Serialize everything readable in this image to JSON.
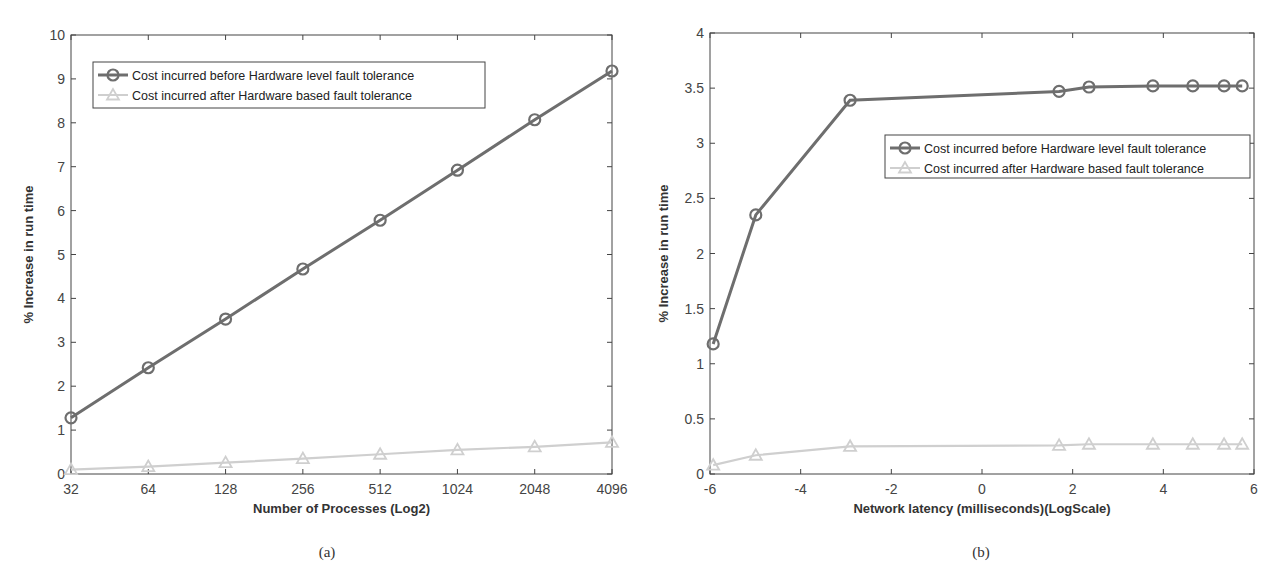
{
  "chart_data": [
    {
      "id": "a",
      "type": "line",
      "caption": "(a)",
      "title": "",
      "xlabel": "Number of Processes (Log2)",
      "ylabel": "% Increase in run time",
      "x_scale": "log2",
      "categories": [
        "32",
        "64",
        "128",
        "256",
        "512",
        "1024",
        "2048",
        "4096"
      ],
      "x": [
        32,
        64,
        128,
        256,
        512,
        1024,
        2048,
        4096
      ],
      "ylim": [
        0,
        10
      ],
      "yticks": [
        0,
        1,
        2,
        3,
        4,
        5,
        6,
        7,
        8,
        9,
        10
      ],
      "grid": false,
      "legend_position": "upper left",
      "series": [
        {
          "name": "Cost incurred before Hardware level fault tolerance",
          "marker": "circle",
          "color": "#6e6e6e",
          "values": [
            1.28,
            2.42,
            3.53,
            4.67,
            5.78,
            6.92,
            8.07,
            9.18
          ]
        },
        {
          "name": "Cost incurred after Hardware based fault tolerance",
          "marker": "triangle",
          "color": "#cfcfcf",
          "values": [
            0.1,
            0.17,
            0.26,
            0.35,
            0.45,
            0.55,
            0.62,
            0.72
          ]
        }
      ]
    },
    {
      "id": "b",
      "type": "line",
      "caption": "(b)",
      "title": "",
      "xlabel": "Network latency (milliseconds)(LogScale)",
      "ylabel": "% Increase in run time",
      "xlim": [
        -6,
        6
      ],
      "xticks": [
        -6,
        -4,
        -2,
        0,
        2,
        4,
        6
      ],
      "ylim": [
        0,
        4
      ],
      "yticks": [
        0,
        0.5,
        1,
        1.5,
        2,
        2.5,
        3,
        3.5,
        4
      ],
      "grid": false,
      "legend_position": "center right",
      "x": [
        -5.93,
        -4.99,
        -2.91,
        1.7,
        2.36,
        3.77,
        4.65,
        5.34,
        5.74
      ],
      "series": [
        {
          "name": "Cost incurred before Hardware level fault tolerance",
          "marker": "circle",
          "color": "#6e6e6e",
          "values": [
            1.18,
            2.35,
            3.39,
            3.47,
            3.51,
            3.52,
            3.52,
            3.52,
            3.52
          ]
        },
        {
          "name": "Cost incurred after Hardware based fault tolerance",
          "marker": "triangle",
          "color": "#cfcfcf",
          "values": [
            0.08,
            0.17,
            0.25,
            0.26,
            0.27,
            0.27,
            0.27,
            0.27,
            0.27
          ]
        }
      ]
    }
  ]
}
